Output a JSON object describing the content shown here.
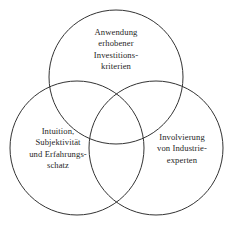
{
  "diagram": {
    "type": "venn-three-set",
    "title": "",
    "background_color": "#ffffff",
    "stroke_color": "#333333",
    "stroke_width": 1,
    "text_color": "#262626",
    "circles": [
      {
        "id": "top",
        "label": "Anwendung erhobener Investitions-kriterien",
        "text": "Anwendung\nerhobener\nInvestitions-\nkriterien",
        "cx": 116,
        "cy": 77,
        "r": 67
      },
      {
        "id": "left",
        "label": "Intuition, Subjektivität und Erfahrungsschatz",
        "text": "Intuition,\nSubjektivität\nund Erfahrungs-\nschatz",
        "cx": 77,
        "cy": 148,
        "r": 67
      },
      {
        "id": "right",
        "label": "Involvierung von Industrieexperten",
        "text": "Involvierung\nvon Industrie-\nexperten",
        "cx": 156,
        "cy": 148,
        "r": 67
      }
    ]
  }
}
